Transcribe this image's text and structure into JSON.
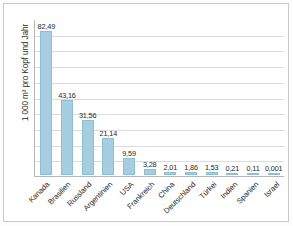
{
  "chart_data": {
    "type": "bar",
    "title": "",
    "subtitle": "",
    "xlabel": "",
    "ylabel": "1 000 m³ pro Kopf und Jahr",
    "ylim": [
      0,
      90
    ],
    "grid": true,
    "gridline_count": 9,
    "legend": null,
    "legend_position": "none",
    "y_tick_labels": [],
    "bar_color": "#a6cde0",
    "bar_border_color": "#8fbed4",
    "categories": [
      "Kanada",
      "Brasilien",
      "Russland",
      "Argentinien",
      "USA",
      "Frankreich",
      "China",
      "Deutschland",
      "Türkei",
      "Indien",
      "Spanien",
      "Israel"
    ],
    "values": [
      82.49,
      43.16,
      31.56,
      21.14,
      9.59,
      3.28,
      2.01,
      1.86,
      1.53,
      0.21,
      0.11,
      0.001
    ],
    "value_labels": [
      "82,49",
      "43,16",
      "31,56",
      "21,14",
      "9,59",
      "3,28",
      "2,01",
      "1,86",
      "1,53",
      "0,21",
      "0,11",
      "0,001"
    ]
  },
  "colors": {
    "bar": "#a6cde0",
    "bar_border": "#8fbed4",
    "gridline": "#dcdcdc",
    "axis": "#b6b6b6",
    "text": "#1f1f1f",
    "page_border": "#c9c9c9"
  }
}
